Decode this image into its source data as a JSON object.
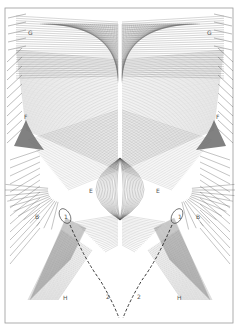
{
  "diagram": {
    "type": "string-art envelope curves",
    "frame": {
      "x": 5,
      "y": 8,
      "width": 228,
      "height": 315,
      "stroke": "#9a9a9a"
    },
    "line_color": "#555555",
    "fill_dark": "#6b6b6b",
    "labels": [
      {
        "id": "G-left",
        "text": "G",
        "x": 28,
        "y": 30
      },
      {
        "id": "G-right",
        "text": "G",
        "x": 207,
        "y": 30
      },
      {
        "id": "F-left",
        "text": "F",
        "x": 24,
        "y": 114
      },
      {
        "id": "F-right",
        "text": "F",
        "x": 216,
        "y": 114
      },
      {
        "id": "E-left",
        "text": "E",
        "x": 89,
        "y": 188
      },
      {
        "id": "E-right",
        "text": "E",
        "x": 156,
        "y": 188
      },
      {
        "id": "B-left",
        "text": "B",
        "x": 35,
        "y": 214
      },
      {
        "id": "B-right",
        "text": "B",
        "x": 196,
        "y": 214
      },
      {
        "id": "1-left",
        "text": "1",
        "x": 64,
        "y": 214
      },
      {
        "id": "1-right",
        "text": "1",
        "x": 178,
        "y": 214
      },
      {
        "id": "H-left",
        "text": "H",
        "x": 63,
        "y": 295
      },
      {
        "id": "H-right",
        "text": "H",
        "x": 177,
        "y": 295
      },
      {
        "id": "2-left",
        "text": "2",
        "x": 106,
        "y": 294
      },
      {
        "id": "2-right",
        "text": "2",
        "x": 137,
        "y": 294
      }
    ]
  }
}
